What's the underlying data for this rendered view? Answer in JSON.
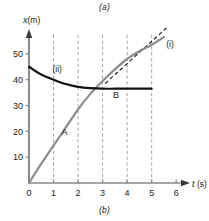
{
  "figure": {
    "caption_top": "(a)",
    "caption_bottom": "(b)"
  },
  "chart_data": {
    "type": "line",
    "title": "",
    "xlabel": "t (s)",
    "ylabel": "x (m)",
    "xlabel_symbol": "t",
    "xlabel_unit": "(s)",
    "ylabel_symbol": "x",
    "ylabel_unit": "(m)",
    "xlim": [
      0,
      6.4
    ],
    "ylim": [
      0,
      60
    ],
    "xticks": [
      0,
      1,
      2,
      3,
      4,
      5,
      6
    ],
    "xtick_labels": [
      "0",
      "1",
      "2",
      "3",
      "4",
      "5",
      "6"
    ],
    "yticks": [
      10,
      20,
      30,
      40,
      50
    ],
    "ytick_labels": [
      "10",
      "20",
      "30",
      "40",
      "50"
    ],
    "grid": "vertical-dashed",
    "gridlines_x": [
      1,
      2,
      3,
      4,
      5
    ],
    "legend_position": "inline-annotations",
    "series": [
      {
        "name": "(i)",
        "label": "(i)",
        "color": "#8c8c8c",
        "style": "solid",
        "point_label": "A",
        "x": [
          0,
          0.5,
          1.0,
          1.5,
          2.0,
          2.5,
          3.0,
          3.5,
          4.0,
          4.5,
          5.0,
          5.5
        ],
        "y": [
          0,
          7.5,
          14.5,
          21.5,
          28.5,
          34.5,
          39.5,
          44.0,
          48.0,
          51.0,
          53.5,
          56.5
        ]
      },
      {
        "name": "(ii)",
        "label": "(ii)",
        "color": "#111111",
        "style": "solid",
        "point_label": "B",
        "x": [
          0,
          0.5,
          1.0,
          1.5,
          2.0,
          2.5,
          3.0,
          3.5,
          4.0,
          4.5,
          5.0
        ],
        "y": [
          45.0,
          42.0,
          40.0,
          38.3,
          37.2,
          36.7,
          36.5,
          36.5,
          36.5,
          36.5,
          36.5
        ]
      },
      {
        "name": "tangent",
        "label": "",
        "color": "#111111",
        "style": "dashed",
        "x": [
          3.1,
          5.6
        ],
        "y": [
          38.5,
          60.0
        ]
      }
    ],
    "annotations": [
      {
        "text": "(i)",
        "x": 5.75,
        "y": 52.5
      },
      {
        "text": "(ii)",
        "x": 1.15,
        "y": 43.0
      },
      {
        "text": "A",
        "x": 1.45,
        "y": 18.5
      },
      {
        "text": "B",
        "x": 3.55,
        "y": 33.0
      }
    ]
  }
}
